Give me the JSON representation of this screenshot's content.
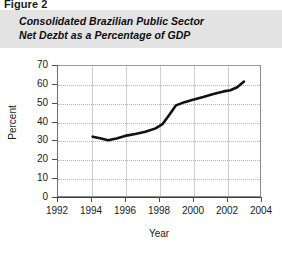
{
  "figure": {
    "label": "Figure 2",
    "title_line1": "Consolidated Brazilian Public Sector",
    "title_line2": "Net Dezbt as a Percentage of GDP",
    "band_color": "#e3e3e3"
  },
  "chart_data": {
    "type": "line",
    "title": "Consolidated Brazilian Public Sector Net Dezbt as a Percentage of GDP",
    "xlabel": "Year",
    "ylabel": "Percent",
    "xlim": [
      1992,
      2004
    ],
    "ylim": [
      0,
      70
    ],
    "xticks": [
      1992,
      1994,
      1996,
      1998,
      2000,
      2002,
      2004
    ],
    "yticks": [
      0,
      10,
      20,
      30,
      40,
      50,
      60,
      70
    ],
    "grid": true,
    "legend": null,
    "line_color": "#111111",
    "series": [
      {
        "name": "Net Debt as % of GDP",
        "x": [
          1994.1,
          1994.6,
          1995.0,
          1995.5,
          1996.0,
          1996.6,
          1997.2,
          1997.8,
          1998.2,
          1998.6,
          1999.0,
          1999.5,
          2000.0,
          2000.6,
          2001.2,
          2001.8,
          2002.2,
          2002.6,
          2003.0
        ],
        "values": [
          32.0,
          31.0,
          30.1,
          31.0,
          32.4,
          33.4,
          34.6,
          36.4,
          38.6,
          43.5,
          48.6,
          50.3,
          51.6,
          53.0,
          54.6,
          56.0,
          56.6,
          58.2,
          61.2
        ]
      }
    ]
  },
  "axis": {
    "ytick_labels": [
      "70",
      "60",
      "50",
      "40",
      "30",
      "20",
      "10",
      "0"
    ],
    "xtick_labels": [
      "1992",
      "1994",
      "1996",
      "1998",
      "2000",
      "2002",
      "2004"
    ]
  }
}
